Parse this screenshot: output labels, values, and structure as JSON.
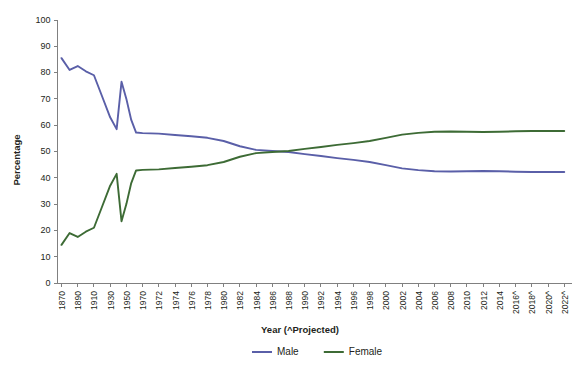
{
  "chart_data": {
    "type": "line",
    "title": "",
    "xlabel": "Year (^Projected)",
    "ylabel": "Percentage",
    "ylim": [
      0,
      100
    ],
    "ytick_step": 10,
    "yticks": [
      0,
      10,
      20,
      30,
      40,
      50,
      60,
      70,
      80,
      90,
      100
    ],
    "grid": false,
    "legend_position": "bottom-center",
    "legend": [
      "Male",
      "Female"
    ],
    "colors": {
      "male": "#5a5fa8",
      "female": "#3d6b35",
      "axis": "#808080",
      "text": "#231f20",
      "background": "#ffffff"
    },
    "categories": [
      "1870",
      "1890",
      "1910",
      "1930",
      "1950",
      "1970",
      "1972",
      "1974",
      "1976",
      "1978",
      "1980",
      "1982",
      "1984",
      "1986",
      "1988",
      "1990",
      "1992",
      "1994",
      "1996",
      "1998",
      "2000",
      "2002",
      "2004",
      "2006",
      "2008",
      "2010",
      "2012",
      "2014",
      "2016^",
      "2018^",
      "2020^",
      "2022^"
    ],
    "xtick_labels": [
      "1870",
      "1890",
      "1910",
      "1930",
      "1950",
      "1970",
      "1972",
      "1974",
      "1976",
      "1978",
      "1980",
      "1982",
      "1984",
      "1986",
      "1988",
      "1990",
      "1992",
      "1994",
      "1996",
      "1998",
      "2000",
      "2002",
      "2004",
      "2006",
      "2008",
      "2010",
      "2012",
      "2014",
      "2016^",
      "2018^",
      "2020^",
      "2022^"
    ],
    "x_positions": [
      0,
      1,
      2,
      3,
      4,
      5,
      6,
      7,
      8,
      9,
      10,
      11,
      12,
      13,
      14,
      15,
      16,
      17,
      18,
      19,
      20,
      21,
      22,
      23,
      24,
      25,
      26,
      27,
      28,
      29,
      30,
      31
    ],
    "series": [
      {
        "name": "Male",
        "color": "#5a5fa8",
        "x": [
          0,
          0.5,
          1,
          1.5,
          2,
          2.5,
          3,
          3.4,
          3.7,
          4,
          4.3,
          4.6,
          5,
          6,
          7,
          8,
          9,
          10,
          11,
          12,
          13,
          14,
          15,
          16,
          17,
          18,
          19,
          20,
          21,
          22,
          23,
          24,
          25,
          26,
          27,
          28,
          29,
          30,
          31
        ],
        "values": [
          85.5,
          81.0,
          82.5,
          80.5,
          79.0,
          71.0,
          63.0,
          58.5,
          76.5,
          70.0,
          62.0,
          57.2,
          57.0,
          56.8,
          56.3,
          55.8,
          55.2,
          54.0,
          52.0,
          50.6,
          50.2,
          49.8,
          49.0,
          48.3,
          47.5,
          46.8,
          46.0,
          44.8,
          43.6,
          42.9,
          42.5,
          42.4,
          42.5,
          42.6,
          42.5,
          42.3,
          42.2,
          42.2,
          42.2
        ]
      },
      {
        "name": "Female",
        "color": "#3d6b35",
        "x": [
          0,
          0.5,
          1,
          1.5,
          2,
          2.5,
          3,
          3.4,
          3.7,
          4,
          4.3,
          4.6,
          5,
          6,
          7,
          8,
          9,
          10,
          11,
          12,
          13,
          14,
          15,
          16,
          17,
          18,
          19,
          20,
          21,
          22,
          23,
          24,
          25,
          26,
          27,
          28,
          29,
          30,
          31
        ],
        "values": [
          14.5,
          19.0,
          17.5,
          19.5,
          21.0,
          29.0,
          37.0,
          41.5,
          23.5,
          30.0,
          38.0,
          42.8,
          43.0,
          43.2,
          43.7,
          44.2,
          44.8,
          46.0,
          48.0,
          49.4,
          49.8,
          50.2,
          51.0,
          51.7,
          52.5,
          53.2,
          54.0,
          55.2,
          56.4,
          57.1,
          57.5,
          57.6,
          57.5,
          57.4,
          57.5,
          57.7,
          57.8,
          57.8,
          57.8
        ]
      }
    ]
  },
  "axis": {
    "y_title": "Percentage",
    "x_title": "Year (^Projected)"
  },
  "legend": {
    "items": [
      {
        "label": "Male",
        "color": "#5a5fa8"
      },
      {
        "label": "Female",
        "color": "#3d6b35"
      }
    ]
  }
}
